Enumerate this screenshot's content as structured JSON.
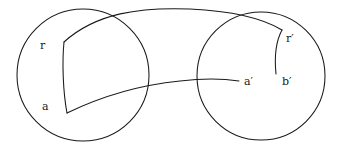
{
  "figure": {
    "kind": "mathematical-diagram",
    "background_color": "#ffffff",
    "stroke_color": "#1a1a1a",
    "width": 342,
    "height": 151
  },
  "labels": {
    "r": "r",
    "a": "a",
    "r_prime": "r′",
    "a_prime": "a′",
    "b_prime": "b′"
  },
  "shapes": {
    "left_circle": {
      "name": "left-neighborhood",
      "cx": 83,
      "cy": 75,
      "r": 66
    },
    "right_circle": {
      "name": "right-neighborhood",
      "cx": 261,
      "cy": 76,
      "r": 64
    },
    "left_region": {
      "name": "curved-quadrilateral",
      "corner_top_left": [
        64,
        42
      ],
      "corner_bottom_left": [
        67,
        113
      ]
    },
    "upper_connector": {
      "name": "upper-connecting-arc",
      "from": [
        64,
        42
      ],
      "to": [
        282,
        30
      ]
    },
    "lower_connector": {
      "name": "lower-connecting-arc",
      "from": [
        67,
        113
      ],
      "to": [
        239,
        81
      ]
    },
    "right_arc": {
      "name": "right-small-arc",
      "from": [
        282,
        30
      ],
      "to": [
        276,
        74
      ]
    }
  }
}
